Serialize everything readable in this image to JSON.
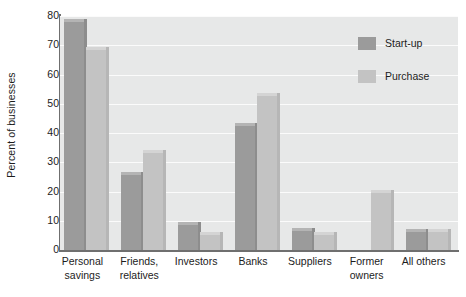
{
  "chart_data": {
    "type": "bar",
    "title": "",
    "xlabel": "",
    "ylabel": "Percent of businesses",
    "ylim": [
      0,
      80
    ],
    "yticks": [
      0,
      10,
      20,
      30,
      40,
      50,
      60,
      70,
      80
    ],
    "ytick_labels": [
      "0",
      "10",
      "20",
      "30",
      "40",
      "50",
      "60",
      "70",
      "80"
    ],
    "grid": "horizontal",
    "legend_position": "top-right",
    "categories": [
      "Personal savings",
      "Friends, relatives",
      "Investors",
      "Banks",
      "Suppliers",
      "Former owners",
      "All others"
    ],
    "category_lines": [
      [
        "Personal",
        "savings"
      ],
      [
        "Friends,",
        "relatives"
      ],
      [
        "Investors",
        ""
      ],
      [
        "Banks",
        ""
      ],
      [
        "Suppliers",
        ""
      ],
      [
        "Former",
        "owners"
      ],
      [
        "All others",
        ""
      ]
    ],
    "series": [
      {
        "name": "Start-up",
        "color": "#9b9b9b",
        "values": [
          78,
          25.5,
          8.5,
          42.5,
          6.5,
          null,
          6
        ]
      },
      {
        "name": "Purchase",
        "color": "#c3c3c3",
        "values": [
          68.5,
          33,
          5,
          52.5,
          5,
          19.5,
          6
        ]
      }
    ]
  },
  "legend": {
    "items": [
      {
        "label": "Start-up",
        "color": "#9b9b9b"
      },
      {
        "label": "Purchase",
        "color": "#c3c3c3"
      }
    ]
  },
  "axes": {
    "y_title": "Percent of businesses"
  },
  "colors": {
    "plot_background": "#e7e8e8",
    "gridline": "#fbfbfb",
    "axis_line": "#6f6f6f",
    "text": "#1c1c1c",
    "page_background": "#ffffff"
  }
}
